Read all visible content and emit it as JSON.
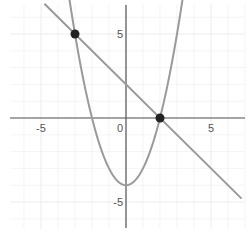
{
  "chart_data": {
    "type": "line",
    "title": "",
    "xlabel": "",
    "ylabel": "",
    "xlim": [
      -6.8,
      7.0
    ],
    "ylim": [
      -6.6,
      6.8
    ],
    "grid": true,
    "x_ticks": [
      {
        "value": -5,
        "label": "-5"
      },
      {
        "value": 0,
        "label": "0"
      },
      {
        "value": 5,
        "label": "5"
      }
    ],
    "y_ticks": [
      {
        "value": 5,
        "label": "5"
      },
      {
        "value": -5,
        "label": "-5"
      }
    ],
    "series": [
      {
        "name": "parabola",
        "equation": "y = x^2 - 4",
        "color": "#9a9a9a"
      },
      {
        "name": "line",
        "equation": "y = -x + 2",
        "color": "#9a9a9a"
      }
    ],
    "points": [
      {
        "x": -3,
        "y": 5,
        "label": "intersection-1"
      },
      {
        "x": 2,
        "y": 0,
        "label": "intersection-2"
      }
    ],
    "legend": null
  },
  "colors": {
    "axis": "#555555",
    "grid": "#ececec",
    "curve": "#9a9a9a",
    "point": "#222222"
  }
}
